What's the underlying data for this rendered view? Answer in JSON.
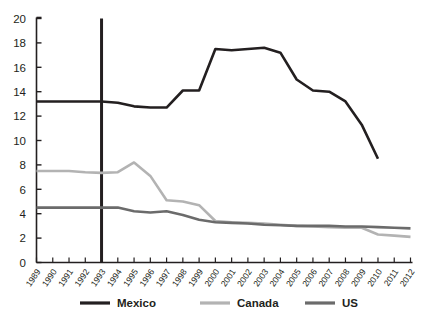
{
  "chart_data": {
    "type": "line",
    "title": "",
    "subtitle": "",
    "xlabel": "",
    "ylabel": "",
    "xlim": [
      1989,
      2012
    ],
    "ylim": [
      0,
      20
    ],
    "ytick_step": 2,
    "yticks": [
      "0",
      "2",
      "4",
      "6",
      "8",
      "10",
      "12",
      "14",
      "16",
      "18",
      "20"
    ],
    "grid": false,
    "legend_position": "bottom",
    "x": [
      1989,
      1990,
      1991,
      1992,
      1993,
      1994,
      1995,
      1996,
      1997,
      1998,
      1999,
      2000,
      2001,
      2002,
      2003,
      2004,
      2005,
      2006,
      2007,
      2008,
      2009,
      2010,
      2011,
      2012
    ],
    "categories": [
      "1989",
      "1990",
      "1991",
      "1992",
      "1993",
      "1994",
      "1995",
      "1996",
      "1997",
      "1998",
      "1999",
      "2000",
      "2001",
      "2002",
      "2003",
      "2004",
      "2005",
      "2006",
      "2007",
      "2008",
      "2009",
      "2010",
      "2011",
      "2012"
    ],
    "series": [
      {
        "name": "Mexico",
        "color": "#231f20",
        "width": 2.6,
        "values": [
          13.2,
          13.2,
          13.2,
          13.2,
          13.2,
          13.1,
          12.8,
          12.7,
          12.7,
          14.1,
          14.1,
          17.5,
          17.4,
          17.5,
          17.6,
          17.2,
          15.0,
          14.1,
          14.0,
          13.2,
          11.3,
          8.5,
          null,
          null
        ]
      },
      {
        "name": "Canada",
        "color": "#b3b3b3",
        "width": 2.6,
        "values": [
          7.5,
          7.5,
          7.5,
          7.4,
          7.35,
          7.4,
          8.2,
          7.1,
          5.1,
          5.0,
          4.7,
          3.4,
          3.3,
          3.25,
          3.2,
          3.1,
          3.0,
          2.95,
          2.9,
          2.85,
          2.85,
          2.3,
          2.2,
          2.1
        ]
      },
      {
        "name": "US",
        "color": "#6b6b6b",
        "width": 2.6,
        "values": [
          4.5,
          4.5,
          4.5,
          4.5,
          4.5,
          4.5,
          4.2,
          4.1,
          4.2,
          3.9,
          3.5,
          3.3,
          3.25,
          3.2,
          3.1,
          3.05,
          3.0,
          3.0,
          3.0,
          2.95,
          2.95,
          2.9,
          2.85,
          2.8
        ]
      }
    ],
    "annotations": [
      {
        "name": "nafta-marker",
        "type": "vline",
        "x": 1993,
        "y_from": 0,
        "y_to": 20,
        "color": "#231f20",
        "width": 3.0,
        "label": ""
      }
    ]
  },
  "legend": {
    "items": [
      {
        "label": "Mexico",
        "color": "#231f20"
      },
      {
        "label": "Canada",
        "color": "#b3b3b3"
      },
      {
        "label": "US",
        "color": "#6b6b6b"
      }
    ]
  },
  "axes": {
    "spine_color": "#231f20",
    "tick_color": "#231f20"
  }
}
